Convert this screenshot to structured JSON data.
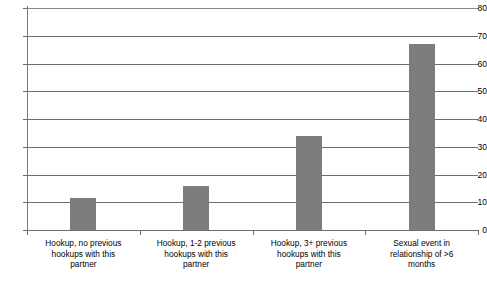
{
  "chart_data": {
    "type": "bar",
    "title": "",
    "subtitle": "",
    "xlabel": "",
    "ylabel": "",
    "ylim": [
      0,
      80
    ],
    "ytick_step": 10,
    "yticks": [
      0,
      10,
      20,
      30,
      40,
      50,
      60,
      70,
      80
    ],
    "ytick_labels": [
      "0",
      "10",
      "20",
      "30",
      "40",
      "50",
      "60",
      "70",
      "80"
    ],
    "grid": true,
    "grid_axis": "y",
    "legend": false,
    "legend_position": "none",
    "bar_color": "#7d7d7d",
    "categories": [
      "Hookup, no previous hookups with this partner",
      "Hookup, 1-2 previous hookups with this partner",
      "Hookup, 3+ previous hookups with this partner",
      "Sexual event in relationship of >6 months"
    ],
    "category_lines": [
      [
        "Hookup, no previous",
        "hookups with this",
        "partner"
      ],
      [
        "Hookup, 1-2 previous",
        "hookups with this",
        "partner"
      ],
      [
        "Hookup, 3+ previous",
        "hookups with this",
        "partner"
      ],
      [
        "Sexual event in",
        "relationship of >6",
        "months"
      ]
    ],
    "values": [
      11.5,
      16,
      34,
      67
    ]
  }
}
